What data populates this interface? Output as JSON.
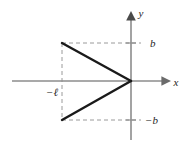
{
  "figure": {
    "type": "math-plot",
    "title": "",
    "background_color": "#ffffff",
    "axis_color": "#8c8c8c",
    "curve_color": "#1a1a1a",
    "dash_color": "#9a9a9a",
    "label_color": "#262626"
  },
  "axes": {
    "x_axis": {
      "label": "x",
      "label_position": {
        "x": 176,
        "y": 85
      },
      "line": {
        "x1": 12,
        "y1": 81,
        "x2": 163,
        "y2": 81
      },
      "arrow": true
    },
    "y_axis": {
      "label": "y",
      "label_position": {
        "x": 140,
        "y": 16
      },
      "line": {
        "x1": 131,
        "y1": 140,
        "x2": 131,
        "y2": 17
      },
      "arrow": true
    },
    "origin": {
      "x": 131,
      "y": 81
    }
  },
  "ticks": [
    {
      "name": "y-tick-positive-b",
      "axis": "y",
      "value_label": "b",
      "pixel": {
        "x": 131,
        "y": 43
      }
    },
    {
      "name": "y-tick-negative-b",
      "axis": "y",
      "value_label": "-b",
      "pixel": {
        "x": 131,
        "y": 120
      }
    }
  ],
  "labels": {
    "b_positive": {
      "text": "b",
      "position": {
        "x": 150,
        "y": 47
      }
    },
    "b_negative": {
      "text": "−b",
      "position": {
        "x": 146,
        "y": 124
      }
    },
    "x_negative_ell": {
      "text": "−ℓ",
      "position": {
        "x": 47,
        "y": 95
      }
    }
  },
  "curve": {
    "name": "triangular-pulse",
    "description": "Triangle with vertical left edge and apex at origin",
    "vertices": [
      {
        "x": 62,
        "y": 43,
        "math": {
          "x": "-ℓ",
          "y": "b"
        }
      },
      {
        "x": 131,
        "y": 81,
        "math": {
          "x": "0",
          "y": "0"
        }
      },
      {
        "x": 62,
        "y": 120,
        "math": {
          "x": "-ℓ",
          "y": "-b"
        }
      }
    ],
    "segments": [
      {
        "name": "upper-segment",
        "from": 0,
        "to": 1
      },
      {
        "name": "lower-segment",
        "from": 1,
        "to": 2
      }
    ],
    "stroke_width": 2.4
  },
  "construction_lines": [
    {
      "name": "dashed-horizontal-top",
      "from": {
        "x": 62,
        "y": 43
      },
      "to": {
        "x": 141,
        "y": 43
      }
    },
    {
      "name": "dashed-horizontal-bottom",
      "from": {
        "x": 62,
        "y": 120
      },
      "to": {
        "x": 141,
        "y": 120
      }
    },
    {
      "name": "dashed-vertical-left",
      "from": {
        "x": 62,
        "y": 43
      },
      "to": {
        "x": 62,
        "y": 120
      }
    }
  ]
}
